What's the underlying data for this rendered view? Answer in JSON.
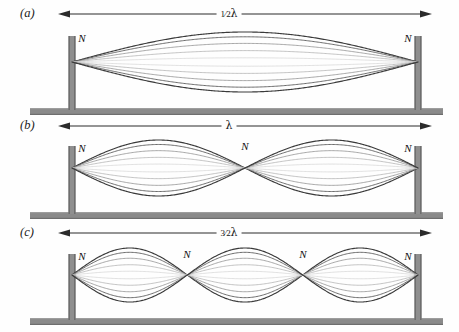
{
  "figure": {
    "colors": {
      "post": "#8f8f8f",
      "post_edge": "#6b6b6b",
      "base": "#8a8a8a",
      "base_edge": "#6e6e6e",
      "wave_dark": "#3a3a3a",
      "wave_mid": "#8d8d8d",
      "wave_light": "#cfcfcf",
      "arrow": "#2b2b2b",
      "text": "#161616"
    },
    "geometry": {
      "left_post_x": 72,
      "right_post_x": 418,
      "string_span": 346
    }
  },
  "panels": [
    {
      "id": "a",
      "letter": "(a)",
      "harmonic": 1,
      "dimension_label_parts": {
        "fraction": "1⁄2",
        "lambda": "λ"
      },
      "dimension_label": "1⁄2 λ",
      "loops": 1,
      "node_count": 2,
      "node_label": "N",
      "node_positions_px": [
        72,
        418
      ],
      "amplitude_px": 30,
      "axis_y_px": 62,
      "baseline_y_px": 108,
      "post_top_y_px": 36,
      "traces": [
        1,
        0.84,
        0.62,
        0.38,
        0.14,
        -0.14,
        -0.38,
        -0.62,
        -0.84,
        -1
      ]
    },
    {
      "id": "b",
      "letter": "(b)",
      "harmonic": 2,
      "dimension_label_parts": {
        "fraction": "",
        "lambda": "λ"
      },
      "dimension_label": "λ",
      "loops": 2,
      "node_count": 3,
      "node_label": "N",
      "node_positions_px": [
        72,
        245,
        418
      ],
      "amplitude_px": 28,
      "axis_y_px": 168,
      "baseline_y_px": 212,
      "post_top_y_px": 146,
      "traces": [
        1,
        0.84,
        0.62,
        0.38,
        0.14,
        -0.14,
        -0.38,
        -0.62,
        -0.84,
        -1
      ]
    },
    {
      "id": "c",
      "letter": "(c)",
      "harmonic": 3,
      "dimension_label_parts": {
        "fraction": "3⁄2",
        "lambda": "λ"
      },
      "dimension_label": "3⁄2 λ",
      "loops": 3,
      "node_count": 4,
      "node_label": "N",
      "node_positions_px": [
        72,
        187,
        303,
        418
      ],
      "amplitude_px": 27,
      "axis_y_px": 275,
      "baseline_y_px": 318,
      "post_top_y_px": 254,
      "traces": [
        1,
        0.84,
        0.62,
        0.38,
        0.14,
        -0.14,
        -0.38,
        -0.62,
        -0.84,
        -1
      ]
    }
  ]
}
